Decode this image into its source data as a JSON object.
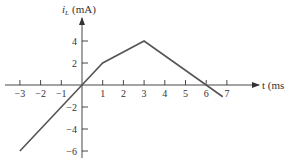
{
  "chart_data": {
    "type": "line",
    "title": "",
    "xlabel": "t (ms)",
    "ylabel_var": "i",
    "ylabel_sub": "L",
    "ylabel_unit": "(mA)",
    "xlim": [
      -3.2,
      8.4
    ],
    "ylim": [
      -6.4,
      6.1
    ],
    "x_ticks": [
      -3,
      -2,
      -1,
      1,
      2,
      3,
      4,
      5,
      6,
      7
    ],
    "x_tick_labels": [
      "−3",
      "−2",
      "−1",
      "1",
      "2",
      "3",
      "4",
      "5",
      "6",
      "7"
    ],
    "y_ticks": [
      4,
      2,
      -2,
      -4,
      -6
    ],
    "y_tick_labels": [
      "4",
      "2",
      "−2",
      "−4",
      "−6"
    ],
    "grid": false,
    "series": [
      {
        "name": "i_L(t)",
        "x": [
          -3,
          0,
          1,
          3,
          6,
          6.8
        ],
        "y": [
          -6,
          0,
          2,
          4,
          0,
          -1.07
        ]
      }
    ],
    "colors": {
      "line": "#555555",
      "axis": "#333333"
    }
  }
}
